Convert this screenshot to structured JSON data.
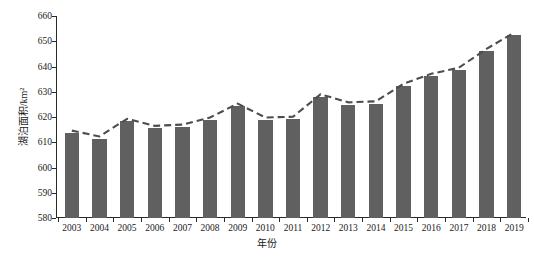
{
  "chart_data": {
    "type": "bar",
    "title": "",
    "xlabel": "年份",
    "ylabel": "湖泊面积/km²",
    "categories": [
      "2003",
      "2004",
      "2005",
      "2006",
      "2007",
      "2008",
      "2009",
      "2010",
      "2011",
      "2012",
      "2013",
      "2014",
      "2015",
      "2016",
      "2017",
      "2018",
      "2019"
    ],
    "values": [
      613.7,
      611.3,
      618.4,
      615.6,
      616.0,
      618.8,
      624.4,
      618.8,
      619.2,
      628.0,
      624.8,
      625.2,
      632.3,
      636.2,
      638.6,
      646.1,
      652.5
    ],
    "series": [
      {
        "name": "湖泊面积",
        "type": "bar",
        "values": [
          613.7,
          611.3,
          618.4,
          615.6,
          616.0,
          618.8,
          624.4,
          618.8,
          619.2,
          628.0,
          624.8,
          625.2,
          632.3,
          636.2,
          638.6,
          646.1,
          652.5
        ]
      },
      {
        "name": "趋势线",
        "type": "line",
        "style": "dashed",
        "values": [
          614.6,
          612.3,
          619.3,
          616.5,
          617.0,
          619.8,
          625.3,
          619.8,
          620.1,
          629.0,
          625.8,
          626.2,
          633.2,
          637.1,
          639.5,
          647.0,
          653.4
        ]
      }
    ],
    "ylim": [
      580,
      660
    ],
    "ytick_step": 10,
    "yticks": [
      580,
      590,
      600,
      610,
      620,
      630,
      640,
      650,
      660
    ],
    "grid": false,
    "legend": "none",
    "bar_color": "#606060",
    "line_color": "#4d4d4d",
    "axis_color": "#2a2a2a"
  }
}
